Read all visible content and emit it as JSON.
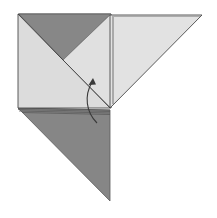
{
  "diagram": {
    "type": "origami-fold-step",
    "colors": {
      "background": "#ffffff",
      "paper_light": "#dcdcdc",
      "paper_light_2": "#e2e2e2",
      "paper_dark": "#8a8a8a",
      "paper_dark_2": "#7f7f7f",
      "edge": "#4a4a4a",
      "arrow": "#3a3a3a"
    },
    "shapes": {
      "left_square": {
        "points": "18,14 111,14 111,109 18,108"
      },
      "top_dark_triangle": {
        "points": "19,14 111,14 63,60"
      },
      "right_flap": {
        "points": "110,15 202,15 110,108"
      },
      "right_flap_inner_edge": {
        "points": "113,17 113,104"
      },
      "diagonal_crease": {
        "x1": 18,
        "y1": 14,
        "x2": 110,
        "y2": 108
      },
      "bottom_dark_triangle": {
        "points": "18,108 110,110 110,201"
      },
      "arrow": {
        "path": "M97,123 C86,112 84,96 93,80",
        "head": "93,78 89,86 97,85"
      }
    }
  }
}
